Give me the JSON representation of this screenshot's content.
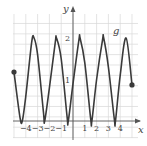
{
  "chart_data": {
    "type": "line",
    "title": "",
    "xlabel": "x",
    "ylabel": "y",
    "function_label": "g",
    "xlim": [
      -5,
      5.5
    ],
    "ylim": [
      -0.6,
      2.5
    ],
    "x_ticks": [
      "-4",
      "-3",
      "-2",
      "-1",
      "1",
      "2",
      "3",
      "4"
    ],
    "x_tick_values": [
      -4,
      -3,
      -2,
      -1,
      1,
      2,
      3,
      4
    ],
    "y_ticks": [
      "1",
      "2"
    ],
    "y_tick_values": [
      1,
      2
    ],
    "grid": true,
    "endpoints": [
      {
        "x": -5,
        "y": 1.18,
        "filled": true
      },
      {
        "x": 5,
        "y": 0.87,
        "filled": true
      }
    ],
    "series": [
      {
        "name": "g",
        "description": "oscillating curve between 0 and 2, about 5 periods on [-5,5]",
        "x": [
          -5,
          -4.5,
          -4.3,
          -4,
          -3.5,
          -3.3,
          -3,
          -2.5,
          -2.4,
          -2,
          -1.5,
          -1.4,
          -1,
          -0.5,
          -0.4,
          0,
          0.5,
          0.6,
          1,
          1.5,
          1.6,
          2,
          2.5,
          2.6,
          3,
          3.5,
          3.6,
          4,
          4.5,
          5
        ],
        "y": [
          1.18,
          0.1,
          0,
          0.6,
          1.9,
          2,
          1.6,
          0.2,
          0,
          0.8,
          1.9,
          2,
          1.5,
          0.1,
          0,
          0.9,
          1.95,
          2,
          1.4,
          0.05,
          0,
          1,
          1.95,
          2,
          1.3,
          0.05,
          0,
          1.1,
          2,
          0.87
        ]
      }
    ],
    "colors": {
      "curve": "#3a3a3a",
      "grid": "#d9d9d9",
      "axis": "#555555"
    }
  }
}
